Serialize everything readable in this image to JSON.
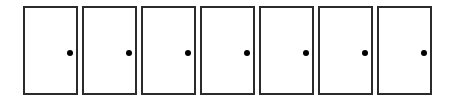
{
  "doors": [
    {
      "label": "Door 1",
      "icon": "door-knob"
    },
    {
      "label": "Door 2",
      "icon": "door-knob"
    },
    {
      "label": "Door 3",
      "icon": "door-knob"
    },
    {
      "label": "Door 4",
      "icon": "door-knob"
    },
    {
      "label": "Door 5",
      "icon": "door-knob"
    },
    {
      "label": "Door 6",
      "icon": "door-knob"
    },
    {
      "label": "Door 7",
      "icon": "door-knob"
    }
  ],
  "colors": {
    "door_border": "#2b2b2b",
    "knob": "#000000",
    "background": "#ffffff"
  }
}
